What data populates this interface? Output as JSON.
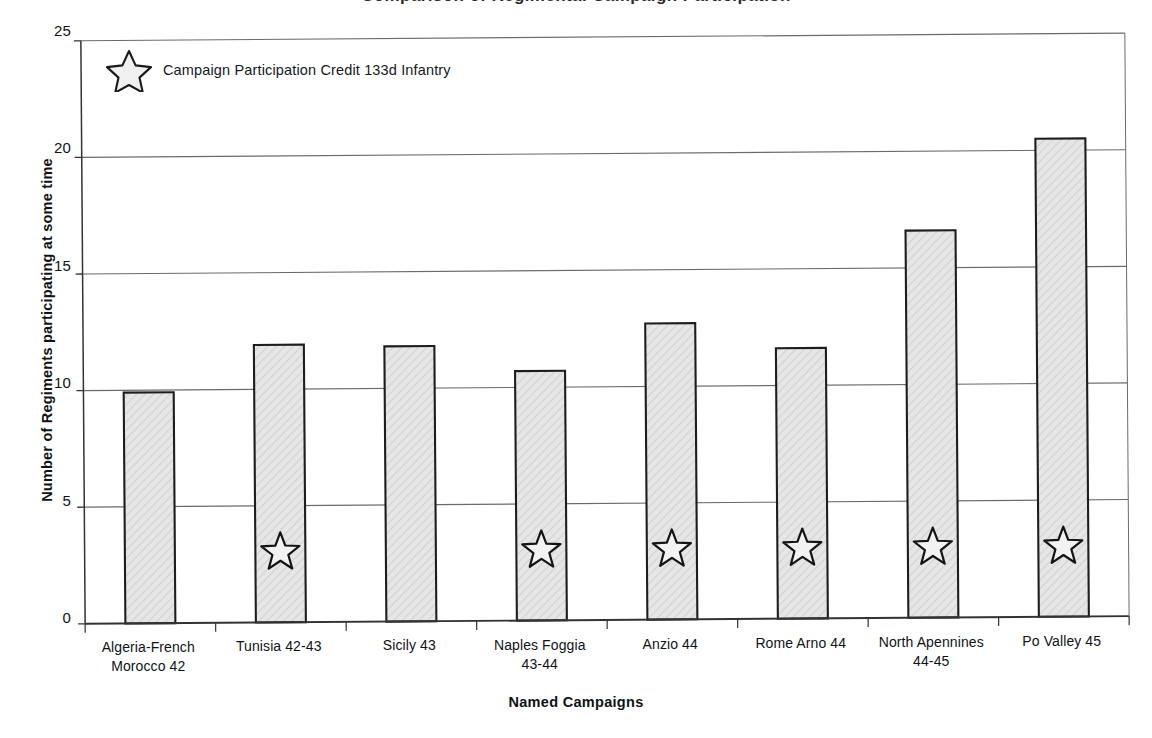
{
  "chart_data": {
    "type": "bar",
    "title": "Comparison of Regimental Campaign Participation",
    "xlabel": "Named Campaigns",
    "ylabel": "Number of Regiments participating at some time",
    "categories": [
      "Algeria-French Morocco 42",
      "Tunisia 42-43",
      "Sicily 43",
      "Naples Foggia 43-44",
      "Anzio 44",
      "Rome Arno 44",
      "North Apennines 44-45",
      "Po Valley 45"
    ],
    "category_lines": [
      [
        "Algeria-French",
        "Morocco 42"
      ],
      [
        "Tunisia 42-43"
      ],
      [
        "Sicily 43"
      ],
      [
        "Naples Foggia",
        "43-44"
      ],
      [
        "Anzio 44"
      ],
      [
        "Rome Arno 44"
      ],
      [
        "North Apennines",
        "44-45"
      ],
      [
        "Po Valley 45"
      ]
    ],
    "values": [
      9.9,
      11.9,
      11.8,
      10.7,
      12.7,
      11.6,
      16.6,
      20.5
    ],
    "campaign_credit": [
      false,
      true,
      false,
      true,
      true,
      true,
      true,
      true
    ],
    "ylim": [
      0,
      25
    ],
    "yticks": [
      0,
      5,
      10,
      15,
      20,
      25
    ],
    "ytick_labels": [
      "0",
      "5",
      "10",
      "15",
      "20",
      "25"
    ],
    "grid": true,
    "legend_position": "top-left",
    "series": [
      {
        "name": "Number of Regiments participating at some time",
        "values": [
          9.9,
          11.9,
          11.8,
          10.7,
          12.7,
          11.6,
          16.6,
          20.5
        ]
      }
    ]
  },
  "legend": {
    "label": "Campaign Participation Credit 133d Infantry",
    "marker": "star-icon"
  },
  "colors": {
    "bar_fill": "#e3e3e3",
    "bar_stroke": "#1d1d1d",
    "grid": "#6b6b6b",
    "axis": "#333333",
    "text": "#101316",
    "star_fill": "#f2f2f2",
    "star_stroke": "#141414",
    "background": "#ffffff"
  }
}
